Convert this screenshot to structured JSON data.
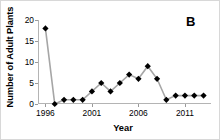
{
  "panel": {
    "label": "B"
  },
  "axes": {
    "ylabel": "Number of Adult Plants",
    "xlabel": "Year",
    "yticks": [
      "0",
      "5",
      "10",
      "15",
      "20"
    ],
    "xticks": [
      "1996",
      "2001",
      "2006",
      "2011"
    ]
  },
  "colors": {
    "marker": "#000000",
    "line": "#a6a6a6",
    "axis": "#b4b4b4",
    "text": "#000000",
    "background": "#ffffff"
  },
  "chart_data": {
    "type": "line",
    "title": "",
    "subtitle": "",
    "xlabel": "Year",
    "ylabel": "Number of Adult Plants",
    "xlim": [
      1995.2,
      2013.8
    ],
    "ylim": [
      0,
      20
    ],
    "yticks": [
      0,
      5,
      10,
      15,
      20
    ],
    "xticks": [
      1996,
      2001,
      2006,
      2011
    ],
    "grid": false,
    "legend": null,
    "annotations": [
      {
        "text": "B",
        "position": "top-right"
      }
    ],
    "marker": "filled-diamond",
    "x": [
      1996,
      1997,
      1998,
      1999,
      2000,
      2001,
      2002,
      2003,
      2004,
      2005,
      2006,
      2007,
      2008,
      2009,
      2010,
      2011,
      2012,
      2013
    ],
    "values": [
      18,
      0,
      1,
      1,
      1,
      3,
      5,
      3,
      5,
      7,
      6,
      9,
      6,
      1,
      2,
      2,
      2,
      2
    ],
    "series": [
      {
        "name": "Number of Adult Plants",
        "values": [
          18,
          0,
          1,
          1,
          1,
          3,
          5,
          3,
          5,
          7,
          6,
          9,
          6,
          1,
          2,
          2,
          2,
          2
        ]
      }
    ]
  }
}
